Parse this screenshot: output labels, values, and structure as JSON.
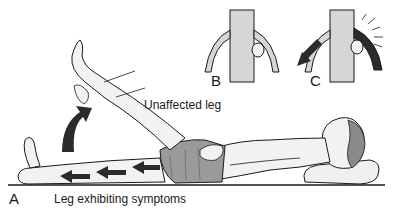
{
  "figure": {
    "panels": {
      "A": {
        "letter": "A",
        "caption": "Leg exhibiting symptoms",
        "raised_leg_label": "Unaffected leg"
      },
      "B": {
        "letter": "B"
      },
      "C": {
        "letter": "C"
      }
    },
    "colors": {
      "ink": "#1a1a1a",
      "skin": "#f2f2f2",
      "shorts": "#9a9a9a",
      "hair": "#8a8a8a",
      "vessel": "#d6d6d6",
      "arrow": "#2b2b2b",
      "inflamed": "#2b2b2b"
    }
  }
}
